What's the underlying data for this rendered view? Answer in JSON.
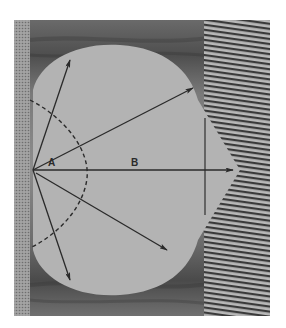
{
  "figure": {
    "frame": {
      "x": 14,
      "y": 20,
      "width": 256,
      "height": 296
    },
    "colors": {
      "page_background": "#ffffff",
      "dark_background": "#5e5e5e",
      "dark_background_light": "#8a8a8a",
      "left_strip": "#9a9a9a",
      "stripe_dark": "#3a3a3a",
      "stripe_light": "#b8b8b8",
      "teardrop_fill": "#b3b3b3",
      "line_color": "#2a2a2a"
    },
    "origin": {
      "x": 33,
      "y": 170
    },
    "labels": {
      "angle_label": "A",
      "distance_label": "B"
    },
    "arrows": [
      {
        "name": "arrow-up-left",
        "x2": 70,
        "y2": 60
      },
      {
        "name": "arrow-upper-right",
        "x2": 193,
        "y2": 88
      },
      {
        "name": "arrow-horizontal-b",
        "x2": 233,
        "y2": 170
      },
      {
        "name": "arrow-lower-right",
        "x2": 167,
        "y2": 250
      },
      {
        "name": "arrow-down",
        "x2": 70,
        "y2": 280
      }
    ],
    "vertical_line": {
      "x": 205,
      "y1": 118,
      "y2": 215
    },
    "teardrop_apex": {
      "x": 240,
      "y": 170
    }
  }
}
